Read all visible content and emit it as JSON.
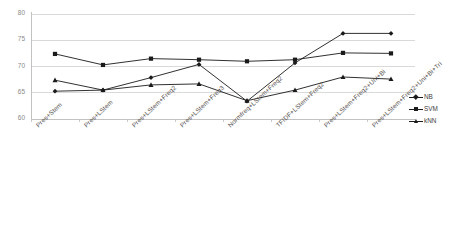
{
  "chart_data": {
    "type": "line",
    "title": "",
    "xlabel": "",
    "ylabel": "",
    "ylim": [
      60,
      80
    ],
    "ytick_labels": [
      "60",
      "65",
      "70",
      "75",
      "80"
    ],
    "ytick_values": [
      60,
      65,
      70,
      75,
      80
    ],
    "grid": true,
    "legend_position": "right",
    "categories": [
      "Pres+Stem",
      "Pres+LStem",
      "Pres+LStem+Freq2",
      "Pres+LStem+Freq3",
      "Normfreq+LStem+Freq2",
      "TFIDF+LStem+Freq2",
      "Pres+LStem+Freq2+Uni+Bi",
      "Pres+LStem+Freq2+Uni+Bi+Tri"
    ],
    "series": [
      {
        "name": "NB",
        "marker": "diamond",
        "color": "#1a1a1a",
        "values": [
          65.2,
          65.4,
          67.8,
          70.3,
          63.3,
          70.6,
          76.2,
          76.2
        ]
      },
      {
        "name": "SVM",
        "marker": "square",
        "color": "#1a1a1a",
        "values": [
          72.3,
          70.2,
          71.4,
          71.2,
          70.9,
          71.2,
          72.5,
          72.4
        ]
      },
      {
        "name": "kNN",
        "marker": "triangle",
        "color": "#1a1a1a",
        "values": [
          67.3,
          65.4,
          66.4,
          66.6,
          63.4,
          65.4,
          67.9,
          67.5
        ]
      }
    ]
  },
  "legend": {
    "entries": [
      {
        "label": "NB",
        "marker": "diamond"
      },
      {
        "label": "SVM",
        "marker": "square"
      },
      {
        "label": "kNN",
        "marker": "triangle"
      }
    ]
  },
  "caption": {
    "text": ""
  }
}
